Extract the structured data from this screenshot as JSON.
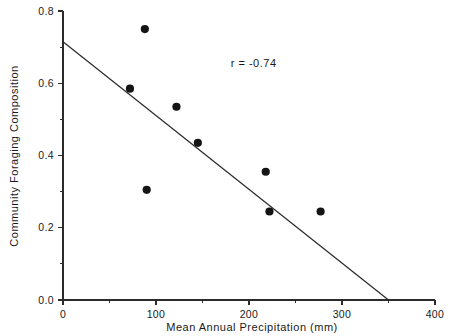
{
  "chart_data": {
    "type": "scatter",
    "title": "",
    "xlabel": "Mean Annual Precipitation (mm)",
    "ylabel": "Community Foraging Composition",
    "xlim": [
      0,
      400
    ],
    "ylim": [
      0.0,
      0.8
    ],
    "grid": false,
    "legend": null,
    "x_ticks": [
      0,
      100,
      200,
      300,
      400
    ],
    "x_tick_labels": [
      "0",
      "100",
      "200",
      "300",
      "400"
    ],
    "x_minor_ticks": [
      50,
      150,
      250,
      350
    ],
    "y_ticks": [
      0.0,
      0.2,
      0.4,
      0.6,
      0.8
    ],
    "y_tick_labels": [
      "0.0",
      "0.2",
      "0.4",
      "0.6",
      "0.8"
    ],
    "y_minor_ticks": [
      0.1,
      0.3,
      0.5,
      0.7
    ],
    "points": [
      {
        "x": 72,
        "y": 0.585
      },
      {
        "x": 88,
        "y": 0.75
      },
      {
        "x": 90,
        "y": 0.305
      },
      {
        "x": 122,
        "y": 0.535
      },
      {
        "x": 145,
        "y": 0.435
      },
      {
        "x": 218,
        "y": 0.355
      },
      {
        "x": 222,
        "y": 0.245
      },
      {
        "x": 277,
        "y": 0.245
      }
    ],
    "trendline": {
      "x0": 0,
      "y0": 0.715,
      "x1": 350,
      "y1": 0.0
    },
    "annotations": [
      {
        "text": "r = -0.74",
        "x": 205,
        "y": 0.645
      }
    ],
    "series_color": "#141414",
    "line_color": "#2b2b2b"
  }
}
